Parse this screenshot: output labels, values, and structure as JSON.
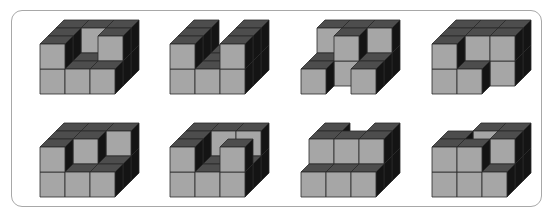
{
  "panel": {
    "title": "",
    "grid": {
      "columns": 4,
      "rows": 2
    }
  },
  "style": {
    "front": "#a6a6a6",
    "top": "#4d4d4d",
    "side": "#141414",
    "edge": "#2a2a2a",
    "frame_border": "#a8a8a8",
    "cube_size": 25,
    "depth_dx": 8,
    "depth_dy": 8
  },
  "figures": [
    {
      "id": 1,
      "left": 40,
      "top": 20,
      "bottom": "full",
      "top_layer": [
        [
          0,
          0
        ],
        [
          0,
          1
        ],
        [
          0,
          2
        ],
        [
          1,
          2
        ],
        [
          2,
          1
        ],
        [
          2,
          2
        ]
      ]
    },
    {
      "id": 2,
      "left": 170,
      "top": 20,
      "bottom": "full",
      "top_layer": [
        [
          0,
          0
        ],
        [
          0,
          1
        ],
        [
          0,
          2
        ],
        [
          2,
          0
        ],
        [
          2,
          1
        ],
        [
          2,
          2
        ]
      ]
    },
    {
      "id": 3,
      "left": 301,
      "top": 20,
      "bottom_missing": [
        [
          1,
          0
        ]
      ],
      "top_layer": [
        [
          0,
          2
        ],
        [
          1,
          2
        ],
        [
          2,
          2
        ],
        [
          1,
          1
        ]
      ]
    },
    {
      "id": 4,
      "left": 432,
      "top": 20,
      "bottom_missing": [
        [
          2,
          0
        ]
      ],
      "top_layer": [
        [
          0,
          0
        ],
        [
          0,
          1
        ],
        [
          0,
          2
        ],
        [
          1,
          1
        ],
        [
          1,
          2
        ],
        [
          2,
          1
        ],
        [
          2,
          2
        ]
      ]
    },
    {
      "id": 5,
      "left": 40,
      "top": 123,
      "bottom": "full",
      "top_layer": [
        [
          0,
          0
        ],
        [
          0,
          1
        ],
        [
          0,
          2
        ],
        [
          1,
          1
        ],
        [
          1,
          2
        ],
        [
          2,
          2
        ]
      ]
    },
    {
      "id": 6,
      "left": 170,
      "top": 123,
      "bottom": "full",
      "top_layer": [
        [
          0,
          0
        ],
        [
          0,
          1
        ],
        [
          0,
          2
        ],
        [
          1,
          2
        ],
        [
          2,
          0
        ],
        [
          2,
          2
        ]
      ]
    },
    {
      "id": 7,
      "left": 301,
      "top": 123,
      "bottom": "full",
      "top_layer": [
        [
          0,
          1
        ],
        [
          0,
          2
        ],
        [
          1,
          1
        ],
        [
          2,
          1
        ],
        [
          2,
          2
        ]
      ]
    },
    {
      "id": 8,
      "left": 432,
      "top": 123,
      "bottom": "full",
      "top_layer": [
        [
          0,
          0
        ],
        [
          0,
          1
        ],
        [
          1,
          0
        ],
        [
          1,
          2
        ],
        [
          2,
          1
        ],
        [
          2,
          2
        ]
      ]
    }
  ]
}
